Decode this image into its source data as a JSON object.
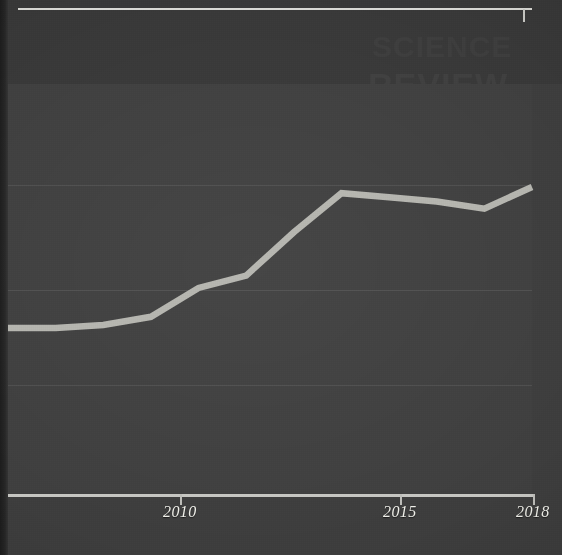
{
  "figure": {
    "surface_color": "#3f3f3f",
    "page_color": "#3d3d3d",
    "line_color": "#b4b4ae",
    "axis_color": "#c6c6c2",
    "label_color": "#efefe9"
  },
  "axis": {
    "tick_labels": [
      "2010",
      "2015",
      "2018"
    ],
    "tick_positions_px": [
      180,
      400,
      533
    ]
  },
  "showthrough_text": {
    "a": "SCIENCE",
    "b": "REVIEW",
    "c": "THE",
    "d": "DATA",
    "e": "figure"
  },
  "chart_data": {
    "type": "line",
    "title": "",
    "subtitle": "",
    "xlabel": "",
    "ylabel": "",
    "grid": true,
    "gridlines_y": [
      3,
      2,
      1
    ],
    "legend": [],
    "xlim": [
      2007,
      2018
    ],
    "ylim": [
      0,
      4
    ],
    "x": [
      2007,
      2008,
      2009,
      2010,
      2011,
      2012,
      2013,
      2014,
      2015,
      2016,
      2017,
      2018
    ],
    "series": [
      {
        "name": "value",
        "color": "#b4b4ae",
        "values": [
          1.63,
          1.63,
          1.66,
          1.74,
          2.02,
          2.14,
          2.56,
          2.94,
          2.9,
          2.86,
          2.79,
          3.0
        ]
      }
    ]
  }
}
